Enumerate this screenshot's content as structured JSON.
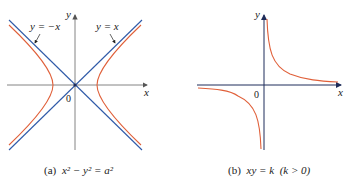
{
  "figure_a": {
    "caption_prefix": "(a)",
    "caption_eq": "x² − y² = a²",
    "axis_x_label": "x",
    "axis_y_label": "y",
    "origin_label": "0",
    "asymptote_left_label": "y = −x",
    "asymptote_right_label": "y = x",
    "curve": "hyperbola x^2 - y^2 = a^2"
  },
  "figure_b": {
    "caption_prefix": "(b)",
    "caption_eq": "xy = k  (k > 0)",
    "axis_x_label": "x",
    "axis_y_label": "y",
    "origin_label": "0",
    "curve": "rectangular hyperbola xy = k"
  },
  "colors": {
    "curve": "#e0603a",
    "asymptote": "#2f5aa8",
    "axis": "#555555",
    "axis_dark": "#1f2d5a"
  }
}
